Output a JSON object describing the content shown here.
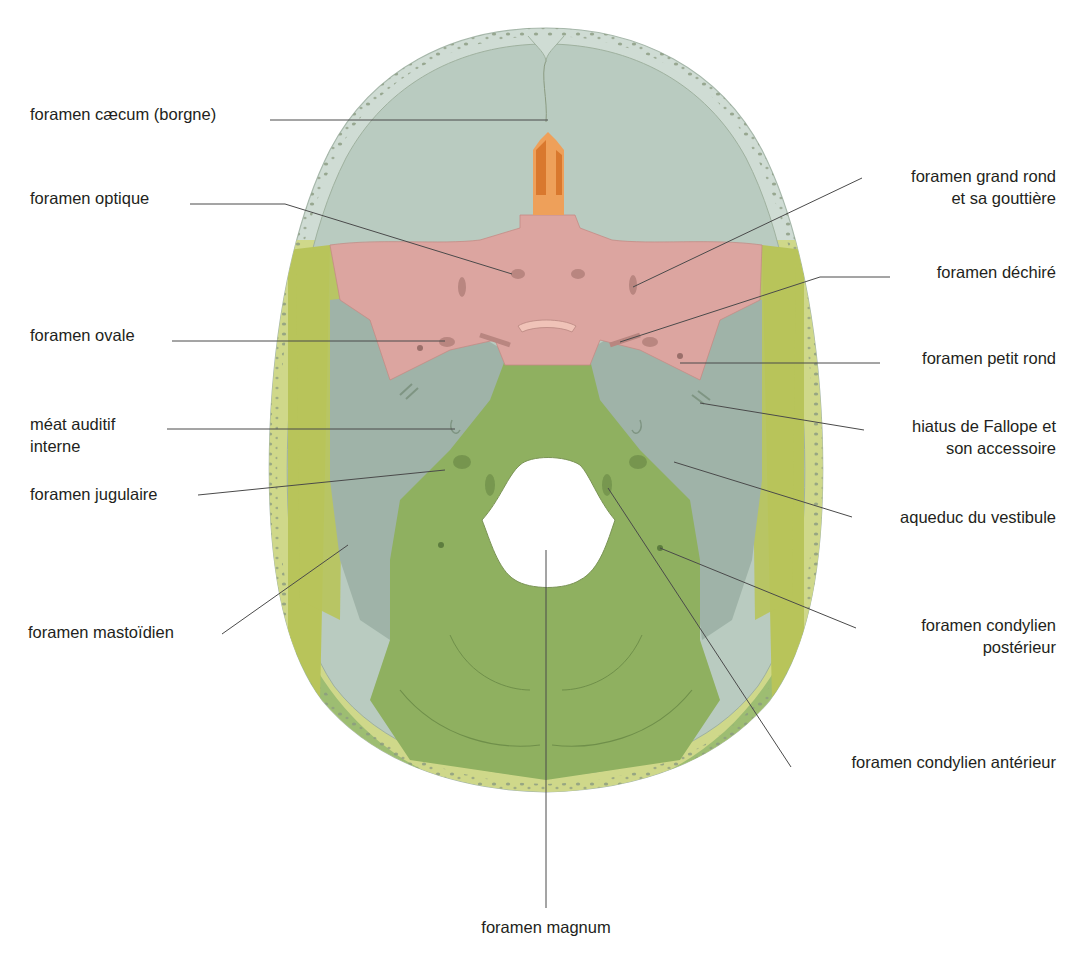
{
  "figure": {
    "colors": {
      "frontal": "#b9cbc0",
      "frontal_rim": "#cfdcd4",
      "parietal_rim": "#cfd88a",
      "parietal": "#b8c45a",
      "sphenoid": "#dca5a0",
      "sphenoid_dark": "#b98680",
      "ethmoid": "#d9782e",
      "ethmoid_light": "#eea05a",
      "temporal": "#9fb3a8",
      "occipital": "#8fb060",
      "occipital_rim": "#9dbd72",
      "diploe": "#8a9a80",
      "leader_line": "#4a4a4a"
    }
  },
  "labels_left": [
    {
      "id": "foramen-caecum",
      "lines": [
        "foramen cæcum (borgne)"
      ]
    },
    {
      "id": "foramen-optique",
      "lines": [
        "foramen optique"
      ]
    },
    {
      "id": "foramen-ovale",
      "lines": [
        "foramen ovale"
      ]
    },
    {
      "id": "meat-auditif-interne",
      "lines": [
        "méat auditif",
        "interne"
      ]
    },
    {
      "id": "foramen-jugulaire",
      "lines": [
        "foramen jugulaire"
      ]
    },
    {
      "id": "foramen-mastoidien",
      "lines": [
        "foramen mastoïdien"
      ]
    }
  ],
  "labels_right": [
    {
      "id": "foramen-grand-rond",
      "lines": [
        "foramen grand rond",
        "et sa gouttière"
      ]
    },
    {
      "id": "foramen-dechire",
      "lines": [
        "foramen déchiré"
      ]
    },
    {
      "id": "foramen-petit-rond",
      "lines": [
        "foramen petit rond"
      ]
    },
    {
      "id": "hiatus-de-fallope",
      "lines": [
        "hiatus de Fallope et",
        "son accessoire"
      ]
    },
    {
      "id": "aqueduc-du-vestibule",
      "lines": [
        "aqueduc du vestibule"
      ]
    },
    {
      "id": "foramen-condylien-posterieur",
      "lines": [
        "foramen condylien",
        "postérieur"
      ]
    },
    {
      "id": "foramen-condylien-anterieur",
      "lines": [
        "foramen condylien antérieur"
      ]
    }
  ],
  "labels_bottom": [
    {
      "id": "foramen-magnum",
      "lines": [
        "foramen magnum"
      ]
    }
  ]
}
